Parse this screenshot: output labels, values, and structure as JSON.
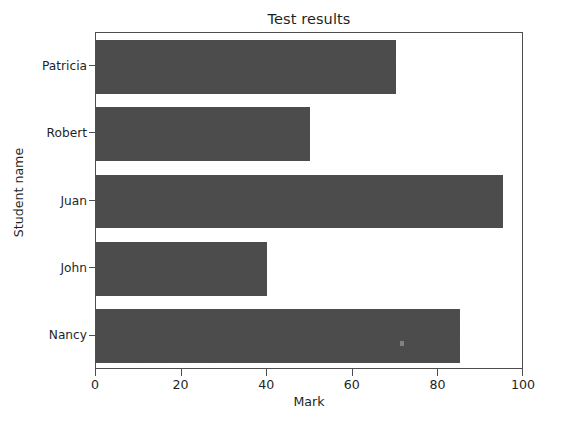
{
  "chart_data": {
    "type": "bar",
    "orientation": "horizontal",
    "title": "Test results",
    "xlabel": "Mark",
    "ylabel": "Student name",
    "categories": [
      "Patricia",
      "Robert",
      "Juan",
      "John",
      "Nancy"
    ],
    "values": [
      70,
      50,
      95,
      40,
      85
    ],
    "xlim": [
      0,
      100
    ],
    "xticks": [
      0,
      20,
      40,
      60,
      80,
      100
    ],
    "xtick_labels": [
      "0",
      "20",
      "40",
      "60",
      "80",
      "100"
    ],
    "ytick_labels": [
      "Patricia",
      "Robert",
      "Juan",
      "John",
      "Nancy"
    ],
    "grid": false,
    "legend": false,
    "bar_color": "#4a4a4a",
    "axes_color": "#4d4d4d",
    "background_color": "#ffffff",
    "text_color": "#1f1f1f"
  },
  "axis": {
    "x_tick_0": "0",
    "x_tick_1": "20",
    "x_tick_2": "40",
    "x_tick_3": "60",
    "x_tick_4": "80",
    "x_tick_5": "100",
    "y_tick_0": "Patricia",
    "y_tick_1": "Robert",
    "y_tick_2": "Juan",
    "y_tick_3": "John",
    "y_tick_4": "Nancy"
  }
}
